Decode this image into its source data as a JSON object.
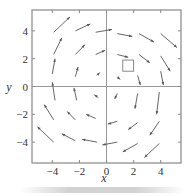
{
  "chart_data": {
    "type": "vector_field",
    "title": "",
    "xlabel": "x",
    "ylabel": "y",
    "xlim": [
      -5.5,
      5.5
    ],
    "ylim": [
      -5.5,
      5.5
    ],
    "xticks": [
      -4,
      -2,
      0,
      2,
      4
    ],
    "yticks": [
      -4,
      -2,
      0,
      2,
      4
    ],
    "xtick_labels": [
      "−4",
      "−2",
      "0",
      "2",
      "4"
    ],
    "ytick_labels": [
      "−4",
      "−2",
      "0",
      "2",
      "4"
    ],
    "grid": false,
    "axes_through_origin": true,
    "arrows": [
      {
        "tail": [
          -3.9,
          3.9
        ],
        "head": [
          -2.7,
          5.0
        ]
      },
      {
        "tail": [
          -2.3,
          4.0
        ],
        "head": [
          -1.2,
          4.5
        ]
      },
      {
        "tail": [
          -0.8,
          3.9
        ],
        "head": [
          0.4,
          4.1
        ]
      },
      {
        "tail": [
          0.8,
          3.8
        ],
        "head": [
          1.9,
          3.6
        ]
      },
      {
        "tail": [
          2.4,
          3.8
        ],
        "head": [
          3.5,
          3.2
        ]
      },
      {
        "tail": [
          4.0,
          3.8
        ],
        "head": [
          5.2,
          2.8
        ]
      },
      {
        "tail": [
          -3.9,
          2.3
        ],
        "head": [
          -3.3,
          3.5
        ]
      },
      {
        "tail": [
          -2.3,
          2.3
        ],
        "head": [
          -1.6,
          3.0
        ]
      },
      {
        "tail": [
          -0.8,
          2.3
        ],
        "head": [
          -0.1,
          2.6
        ]
      },
      {
        "tail": [
          0.8,
          2.3
        ],
        "head": [
          1.6,
          2.1
        ]
      },
      {
        "tail": [
          2.4,
          2.3
        ],
        "head": [
          3.2,
          1.7
        ]
      },
      {
        "tail": [
          4.0,
          2.2
        ],
        "head": [
          4.7,
          1.1
        ]
      },
      {
        "tail": [
          -4.0,
          0.9
        ],
        "head": [
          -3.8,
          2.0
        ]
      },
      {
        "tail": [
          -2.3,
          0.7
        ],
        "head": [
          -2.1,
          1.4
        ]
      },
      {
        "tail": [
          -0.7,
          0.8
        ],
        "head": [
          -0.5,
          1.0
        ]
      },
      {
        "tail": [
          0.8,
          0.7
        ],
        "head": [
          1.0,
          0.5
        ]
      },
      {
        "tail": [
          2.3,
          0.8
        ],
        "head": [
          2.5,
          0.1
        ]
      },
      {
        "tail": [
          4.0,
          1.1
        ],
        "head": [
          4.2,
          0.1
        ]
      },
      {
        "tail": [
          -3.8,
          -1.0
        ],
        "head": [
          -4.0,
          0.3
        ]
      },
      {
        "tail": [
          -2.2,
          -1.0
        ],
        "head": [
          -2.4,
          -0.1
        ]
      },
      {
        "tail": [
          -0.6,
          -0.8
        ],
        "head": [
          -0.9,
          -0.6
        ]
      },
      {
        "tail": [
          0.8,
          -0.5
        ],
        "head": [
          0.6,
          -0.9
        ]
      },
      {
        "tail": [
          2.3,
          -0.5
        ],
        "head": [
          2.1,
          -1.6
        ]
      },
      {
        "tail": [
          3.9,
          -0.4
        ],
        "head": [
          3.7,
          -2.0
        ]
      },
      {
        "tail": [
          -3.9,
          -2.4
        ],
        "head": [
          -4.6,
          -1.3
        ]
      },
      {
        "tail": [
          -2.3,
          -2.4
        ],
        "head": [
          -2.9,
          -1.8
        ]
      },
      {
        "tail": [
          -0.8,
          -2.3
        ],
        "head": [
          -1.5,
          -2.0
        ]
      },
      {
        "tail": [
          0.8,
          -2.5
        ],
        "head": [
          0.1,
          -2.7
        ]
      },
      {
        "tail": [
          2.3,
          -2.6
        ],
        "head": [
          1.6,
          -3.1
        ]
      },
      {
        "tail": [
          3.9,
          -2.5
        ],
        "head": [
          3.2,
          -3.5
        ]
      },
      {
        "tail": [
          -3.9,
          -4.0
        ],
        "head": [
          -5.1,
          -2.9
        ]
      },
      {
        "tail": [
          -2.3,
          -3.9
        ],
        "head": [
          -3.3,
          -3.4
        ]
      },
      {
        "tail": [
          -0.7,
          -4.0
        ],
        "head": [
          -1.8,
          -3.8
        ]
      },
      {
        "tail": [
          0.8,
          -4.0
        ],
        "head": [
          -0.3,
          -4.2
        ]
      },
      {
        "tail": [
          2.3,
          -4.1
        ],
        "head": [
          1.2,
          -4.7
        ]
      },
      {
        "tail": [
          3.9,
          -4.1
        ],
        "head": [
          2.8,
          -5.1
        ]
      }
    ],
    "annotations": [
      {
        "type": "square",
        "x0": 1.2,
        "y0": 1.1,
        "x1": 2.0,
        "y1": 1.9
      }
    ]
  },
  "colors": {
    "frame": "#888888",
    "axis": "#999999",
    "arrow": "#555555",
    "text": "#333333"
  }
}
